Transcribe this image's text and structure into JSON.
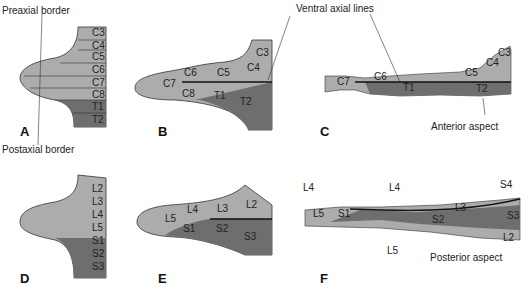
{
  "colors": {
    "light": "#acacac",
    "dark": "#6e6e6e",
    "line": "#333333",
    "background": "#ffffff"
  },
  "panels": {
    "A": "A",
    "B": "B",
    "C": "C",
    "D": "D",
    "E": "E",
    "F": "F"
  },
  "annotations": {
    "preaxial": "Preaxial border",
    "postaxial": "Postaxial border",
    "ventral_axial": "Ventral axial lines",
    "anterior": "Anterior aspect",
    "posterior": "Posterior aspect"
  },
  "A": {
    "segments": [
      "C3",
      "C4",
      "C5",
      "C6",
      "C7",
      "C8",
      "T1",
      "T2"
    ]
  },
  "B": {
    "segments": [
      "C3",
      "C4",
      "C5",
      "C6",
      "C7",
      "C8",
      "T1",
      "T2"
    ]
  },
  "C": {
    "segments": [
      "C3",
      "C4",
      "C5",
      "C6",
      "C7",
      "T1",
      "T2"
    ]
  },
  "D": {
    "segments": [
      "L2",
      "L3",
      "L4",
      "L5",
      "S1",
      "S2",
      "S3"
    ]
  },
  "E": {
    "segments": [
      "L2",
      "L3",
      "L4",
      "L5",
      "S1",
      "S2",
      "S3"
    ]
  },
  "F": {
    "segments": [
      "L4",
      "L4",
      "L5",
      "S1",
      "S2",
      "L3",
      "S4",
      "S3",
      "L2",
      "L5"
    ]
  }
}
